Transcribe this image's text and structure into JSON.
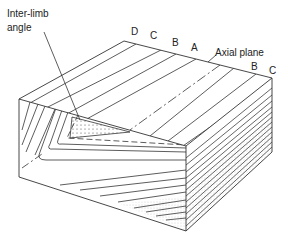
{
  "figure": {
    "labels": {
      "interlimb_line1": "Inter-limb",
      "interlimb_line2": "angle",
      "axial_plane": "Axial plane",
      "left_layers": [
        "D",
        "C",
        "B",
        "A"
      ],
      "right_layers": [
        "B",
        "C"
      ]
    },
    "colors": {
      "line": "#333333",
      "background": "#ffffff",
      "stipple": "#555555"
    }
  }
}
